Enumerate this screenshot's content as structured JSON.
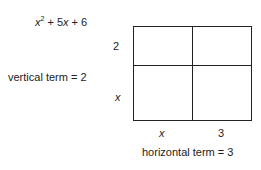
{
  "expression": {
    "x": "x",
    "exp": "2",
    "rest": " + 5",
    "x2": "x",
    "tail": " + 6"
  },
  "vertical_label": "vertical term = 2",
  "horizontal_label": "horizontal term = 3",
  "row_labels": [
    "2",
    "x"
  ],
  "col_labels": [
    "x",
    "3"
  ],
  "grid": {
    "rows": 2,
    "cols": 2
  }
}
